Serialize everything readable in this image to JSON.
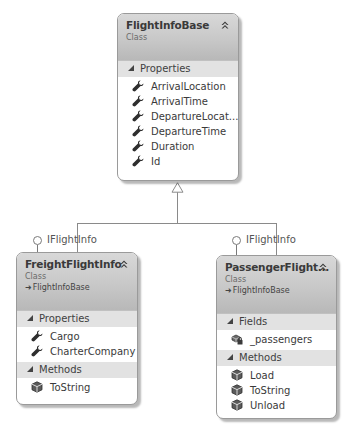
{
  "diagram": {
    "classes": [
      {
        "id": "FlightInfoBase",
        "title": "FlightInfoBase",
        "stereotype": "Class",
        "sections": [
          {
            "label": "Properties",
            "members": [
              {
                "name": "ArrivalLocation",
                "icon": "property-wrench-icon"
              },
              {
                "name": "ArrivalTime",
                "icon": "property-wrench-icon"
              },
              {
                "name": "DepartureLocat...",
                "icon": "property-wrench-icon"
              },
              {
                "name": "DepartureTime",
                "icon": "property-wrench-icon"
              },
              {
                "name": "Duration",
                "icon": "property-wrench-icon"
              },
              {
                "name": "Id",
                "icon": "property-wrench-icon"
              }
            ]
          }
        ]
      },
      {
        "id": "FreightFlightInfo",
        "title": "FreightFlightInfo",
        "stereotype": "Class",
        "base": "FlightInfoBase",
        "interface": "IFlightInfo",
        "sections": [
          {
            "label": "Properties",
            "members": [
              {
                "name": "Cargo",
                "icon": "property-wrench-icon"
              },
              {
                "name": "CharterCompany",
                "icon": "property-wrench-icon"
              }
            ]
          },
          {
            "label": "Methods",
            "members": [
              {
                "name": "ToString",
                "icon": "method-cube-icon"
              }
            ]
          }
        ]
      },
      {
        "id": "PassengerFlightInfo",
        "title": "PassengerFlight...",
        "stereotype": "Class",
        "base": "FlightInfoBase",
        "interface": "IFlightInfo",
        "sections": [
          {
            "label": "Fields",
            "members": [
              {
                "name": "_passengers",
                "icon": "private-field-icon"
              }
            ]
          },
          {
            "label": "Methods",
            "members": [
              {
                "name": "Load",
                "icon": "method-cube-icon"
              },
              {
                "name": "ToString",
                "icon": "method-cube-icon"
              },
              {
                "name": "Unload",
                "icon": "method-cube-icon"
              }
            ]
          }
        ]
      }
    ],
    "relationships": [
      {
        "type": "inheritance",
        "from": "FreightFlightInfo",
        "to": "FlightInfoBase"
      },
      {
        "type": "inheritance",
        "from": "PassengerFlightInfo",
        "to": "FlightInfoBase"
      },
      {
        "type": "implements",
        "from": "FreightFlightInfo",
        "to": "IFlightInfo"
      },
      {
        "type": "implements",
        "from": "PassengerFlightInfo",
        "to": "IFlightInfo"
      }
    ],
    "colors": {
      "header_gradient_top": "#d8d8d8",
      "header_gradient_bottom": "#b8b8b8",
      "section_header_bg": "#e2e2e2",
      "connector": "#8a8a8a",
      "border": "#9a9a9a"
    }
  }
}
